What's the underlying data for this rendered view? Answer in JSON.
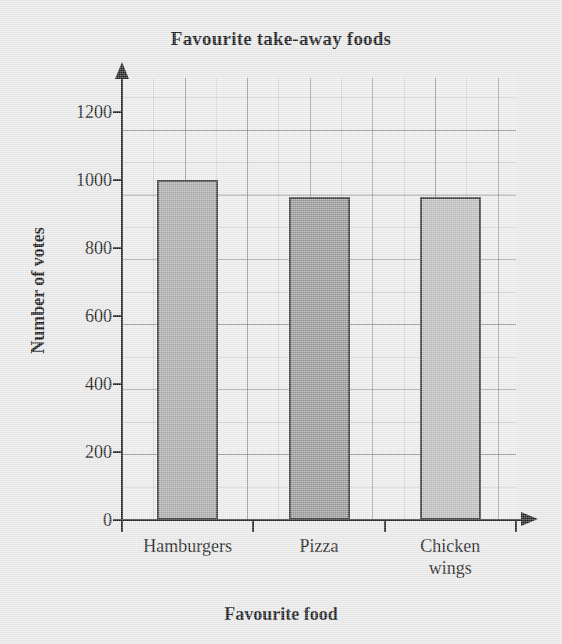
{
  "chart_data": {
    "type": "bar",
    "title": "Favourite take-away foods",
    "xlabel": "Favourite food",
    "ylabel": "Number of votes",
    "categories": [
      "Hamburgers",
      "Pizza",
      "Chicken wings"
    ],
    "values": [
      1000,
      950,
      950
    ],
    "ylim": [
      0,
      1300
    ],
    "yticks": [
      0,
      200,
      400,
      600,
      800,
      1000,
      1200
    ],
    "ytick_labels": [
      "0",
      "200",
      "400",
      "600",
      "800",
      "1000",
      "1200"
    ],
    "minor_tick_step": 100,
    "grid": true,
    "legend": "none",
    "bar_colors": [
      "#a9a9a9",
      "#979797",
      "#bcbcbc"
    ],
    "bar_edge_color": "#3a3a3a",
    "category_label_lines": [
      [
        "Hamburgers"
      ],
      [
        "Pizza"
      ],
      [
        "Chicken",
        "wings"
      ]
    ]
  },
  "style": {
    "page_background": "#e9e9e9",
    "plot_background": "#ececec",
    "axis_color": "#1d1d1d",
    "grid_color": "#787878"
  }
}
